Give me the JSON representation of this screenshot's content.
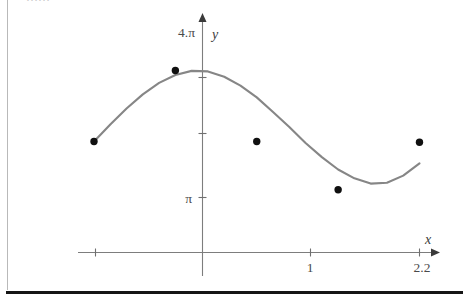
{
  "page": {
    "clipped_header_text": "……"
  },
  "chart_data": {
    "type": "line",
    "title": "",
    "subtitle": "",
    "xlabel": "x",
    "ylabel": "y",
    "grid": false,
    "legend": null,
    "xlim": [
      -1.0,
      2.2
    ],
    "ylim": [
      0,
      12.566
    ],
    "x_ticks": [
      {
        "value": -1,
        "label": ""
      },
      {
        "value": 0,
        "label": ""
      },
      {
        "value": 1,
        "label": "1"
      },
      {
        "value": 2.2,
        "label": "2.2"
      }
    ],
    "y_ticks": [
      {
        "value": 3.1416,
        "label": "π"
      },
      {
        "value": 6.2832,
        "label": ""
      },
      {
        "value": 9.4248,
        "label": ""
      },
      {
        "value": 12.5664,
        "label": "4.π"
      }
    ],
    "y_axis_top_label": "4.π",
    "y_axis_pi_label": "π",
    "series": [
      {
        "name": "curve",
        "color": "#868686",
        "x": [
          -1.0,
          -0.85,
          -0.7,
          -0.55,
          -0.4,
          -0.25,
          -0.1,
          0.05,
          0.2,
          0.35,
          0.5,
          0.65,
          0.8,
          0.95,
          1.1,
          1.25,
          1.4,
          1.55,
          1.7,
          1.85,
          2.0,
          2.0
        ],
        "y": [
          6.28,
          7.25,
          8.15,
          8.95,
          9.6,
          10.05,
          10.28,
          10.25,
          9.95,
          9.45,
          8.78,
          7.95,
          7.1,
          6.2,
          5.4,
          4.7,
          4.2,
          3.9,
          3.95,
          4.35,
          5.05,
          6.28
        ]
      }
    ],
    "points": [
      {
        "label": "",
        "x": -1.0,
        "y": 6.28
      },
      {
        "label": "",
        "x": -0.25,
        "y": 10.3
      },
      {
        "label": "",
        "x": 0.5,
        "y": 6.28
      },
      {
        "label": "",
        "x": 1.25,
        "y": 3.55
      },
      {
        "label": "",
        "x": 2.0,
        "y": 6.24
      }
    ],
    "colors": {
      "curve": "#868686",
      "point": "#101010",
      "axis": "#7d7d7d",
      "label": "#4a4a4a"
    }
  }
}
